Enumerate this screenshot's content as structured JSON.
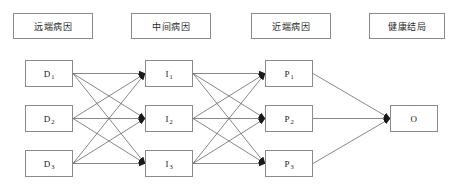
{
  "diagram": {
    "canvas": {
      "width": 457,
      "height": 195,
      "background": "#ffffff"
    },
    "stroke_color": "#555555",
    "box_border_color": "#8a8a8a",
    "headers": [
      {
        "id": "header-distal",
        "label": "远端病因",
        "x": 13,
        "y": 13,
        "w": 80,
        "h": 26
      },
      {
        "id": "header-intermediate",
        "label": "中间病因",
        "x": 131,
        "y": 13,
        "w": 80,
        "h": 26
      },
      {
        "id": "header-proximal",
        "label": "近端病因",
        "x": 251,
        "y": 13,
        "w": 80,
        "h": 26
      },
      {
        "id": "header-outcome",
        "label": "健康结局",
        "x": 369,
        "y": 13,
        "w": 76,
        "h": 26
      }
    ],
    "columns": [
      {
        "id": "column-distal",
        "header_ref": "header-distal",
        "nodes": [
          {
            "id": "D1",
            "base": "D",
            "sub": "1",
            "x": 25,
            "y": 60,
            "w": 48,
            "h": 27
          },
          {
            "id": "D2",
            "base": "D",
            "sub": "2",
            "x": 25,
            "y": 105,
            "w": 48,
            "h": 27
          },
          {
            "id": "D3",
            "base": "D",
            "sub": "3",
            "x": 25,
            "y": 150,
            "w": 48,
            "h": 27
          }
        ]
      },
      {
        "id": "column-intermediate",
        "header_ref": "header-intermediate",
        "nodes": [
          {
            "id": "I1",
            "base": "I",
            "sub": "1",
            "x": 145,
            "y": 60,
            "w": 48,
            "h": 27
          },
          {
            "id": "I2",
            "base": "I",
            "sub": "2",
            "x": 145,
            "y": 105,
            "w": 48,
            "h": 27
          },
          {
            "id": "I3",
            "base": "I",
            "sub": "3",
            "x": 145,
            "y": 150,
            "w": 48,
            "h": 27
          }
        ]
      },
      {
        "id": "column-proximal",
        "header_ref": "header-proximal",
        "nodes": [
          {
            "id": "P1",
            "base": "P",
            "sub": "1",
            "x": 265,
            "y": 60,
            "w": 48,
            "h": 27
          },
          {
            "id": "P2",
            "base": "P",
            "sub": "2",
            "x": 265,
            "y": 105,
            "w": 48,
            "h": 27
          },
          {
            "id": "P3",
            "base": "P",
            "sub": "3",
            "x": 265,
            "y": 150,
            "w": 48,
            "h": 27
          }
        ]
      },
      {
        "id": "column-outcome",
        "header_ref": "header-outcome",
        "nodes": [
          {
            "id": "O",
            "base": "O",
            "sub": "",
            "x": 390,
            "y": 105,
            "w": 48,
            "h": 27
          }
        ]
      }
    ],
    "edges": [
      {
        "from": "D1",
        "to": "I1"
      },
      {
        "from": "D1",
        "to": "I2"
      },
      {
        "from": "D1",
        "to": "I3"
      },
      {
        "from": "D2",
        "to": "I1"
      },
      {
        "from": "D2",
        "to": "I2"
      },
      {
        "from": "D2",
        "to": "I3"
      },
      {
        "from": "D3",
        "to": "I1"
      },
      {
        "from": "D3",
        "to": "I2"
      },
      {
        "from": "D3",
        "to": "I3"
      },
      {
        "from": "I1",
        "to": "P1"
      },
      {
        "from": "I1",
        "to": "P2"
      },
      {
        "from": "I1",
        "to": "P3"
      },
      {
        "from": "I2",
        "to": "P1"
      },
      {
        "from": "I2",
        "to": "P2"
      },
      {
        "from": "I2",
        "to": "P3"
      },
      {
        "from": "I3",
        "to": "P1"
      },
      {
        "from": "I3",
        "to": "P2"
      },
      {
        "from": "I3",
        "to": "P3"
      },
      {
        "from": "P1",
        "to": "O"
      },
      {
        "from": "P2",
        "to": "O"
      },
      {
        "from": "P3",
        "to": "O"
      }
    ]
  }
}
